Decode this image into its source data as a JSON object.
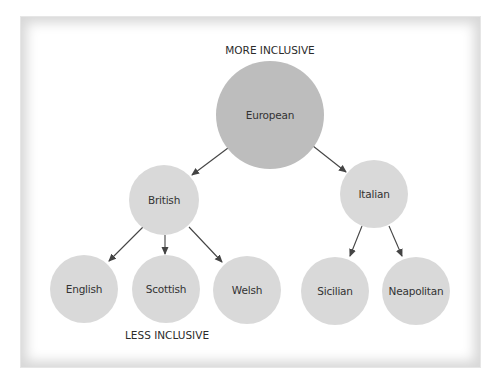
{
  "diagram": {
    "top_label": "MORE INCLUSIVE",
    "bottom_label": "LESS INCLUSIVE",
    "colors": {
      "root_fill": "#bdbdbd",
      "node_fill": "#d9d9d9",
      "arrow": "#444444",
      "text": "#333333"
    },
    "nodes": [
      {
        "id": "european",
        "label": "European",
        "level": 0,
        "cx": 270,
        "cy": 115,
        "r": 54
      },
      {
        "id": "british",
        "label": "British",
        "level": 1,
        "cx": 164,
        "cy": 200,
        "r": 35
      },
      {
        "id": "italian",
        "label": "Italian",
        "level": 1,
        "cx": 374,
        "cy": 194,
        "r": 34
      },
      {
        "id": "english",
        "label": "English",
        "level": 2,
        "cx": 84,
        "cy": 289,
        "r": 34
      },
      {
        "id": "scottish",
        "label": "Scottish",
        "level": 2,
        "cx": 166,
        "cy": 289,
        "r": 34
      },
      {
        "id": "welsh",
        "label": "Welsh",
        "level": 2,
        "cx": 247,
        "cy": 290,
        "r": 34
      },
      {
        "id": "sicilian",
        "label": "Sicilian",
        "level": 2,
        "cx": 335,
        "cy": 291,
        "r": 34
      },
      {
        "id": "neapolitan",
        "label": "Neapolitan",
        "level": 2,
        "cx": 416,
        "cy": 291,
        "r": 34
      }
    ],
    "edges": [
      {
        "from": "european",
        "to": "british",
        "x1": 228,
        "y1": 148,
        "x2": 192,
        "y2": 175
      },
      {
        "from": "european",
        "to": "italian",
        "x1": 313,
        "y1": 146,
        "x2": 346,
        "y2": 172
      },
      {
        "from": "british",
        "to": "english",
        "x1": 143,
        "y1": 227,
        "x2": 109,
        "y2": 261
      },
      {
        "from": "british",
        "to": "scottish",
        "x1": 165,
        "y1": 235,
        "x2": 165,
        "y2": 254
      },
      {
        "from": "british",
        "to": "welsh",
        "x1": 189,
        "y1": 227,
        "x2": 222,
        "y2": 262
      },
      {
        "from": "italian",
        "to": "sicilian",
        "x1": 362,
        "y1": 226,
        "x2": 350,
        "y2": 256
      },
      {
        "from": "italian",
        "to": "neapolitan",
        "x1": 389,
        "y1": 226,
        "x2": 402,
        "y2": 256
      }
    ]
  }
}
